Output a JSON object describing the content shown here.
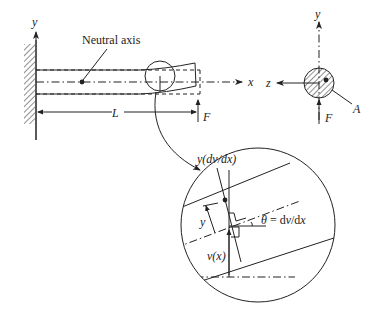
{
  "diagram": {
    "labels": {
      "neutral_axis": "Neutral axis",
      "y_axis_beam": "y",
      "x_axis": "x",
      "length": "L",
      "force_beam": "F",
      "y_axis_section": "y",
      "z_axis": "z",
      "force_section": "F",
      "area": "A",
      "detail_slope_offset": "y(dv/dx)",
      "detail_y": "y",
      "detail_theta": "θ = dv/dx",
      "detail_deflection": "v(x)"
    },
    "colors": {
      "ink": "#222222",
      "background": "#ffffff"
    }
  }
}
